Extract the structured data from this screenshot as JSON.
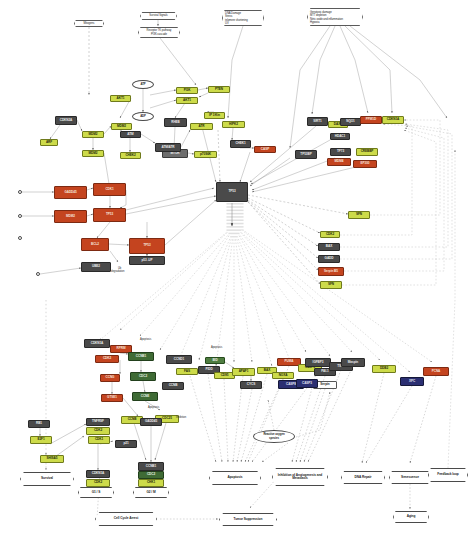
{
  "diagram": {
    "width": 471,
    "height": 543,
    "background": "#ffffff"
  },
  "palette": {
    "red": "#c4441f",
    "gray": "#4a4a4a",
    "yellow_green": "#cddb4a",
    "green": "#3f6b35",
    "navy": "#2b2f72",
    "orange": "#d2582a",
    "white": "#ffffff",
    "edge": "#8a8a8a"
  },
  "stimuli": [
    {
      "id": "st_mito",
      "lines": [
        "Mitogens"
      ],
      "x": 74,
      "y": 20,
      "w": 30,
      "h": 7,
      "plain": true
    },
    {
      "id": "st_surv",
      "lines": [
        "Survival Signals"
      ],
      "x": 140,
      "y": 12,
      "w": 37,
      "h": 8
    },
    {
      "id": "st_pi3k",
      "lines": [
        "Receptor TK pathway",
        "PI3K cascade"
      ],
      "x": 138,
      "y": 27,
      "w": 42,
      "h": 11
    },
    {
      "id": "st_dna",
      "lines": [
        "DNA Damage",
        "Stress",
        "telomere shortening",
        "UV"
      ],
      "x": 222,
      "y": 10,
      "w": 42,
      "h": 16
    },
    {
      "id": "st_geno",
      "lines": [
        "Genotoxic damage",
        "MTT depletion",
        "Nitric oxide and inflammation",
        "Hypoxia"
      ],
      "x": 307,
      "y": 8,
      "w": 56,
      "h": 18
    }
  ],
  "metabolites": [
    {
      "id": "m_atp",
      "lines": [
        "ATP"
      ],
      "x": 132,
      "y": 80,
      "w": 22,
      "h": 9
    },
    {
      "id": "m_adp",
      "lines": [
        "ADP"
      ],
      "x": 132,
      "y": 112,
      "w": 22,
      "h": 9
    },
    {
      "id": "m_ros",
      "lines": [
        "Reactive oxygen",
        "species"
      ],
      "x": 253,
      "y": 430,
      "w": 42,
      "h": 13
    }
  ],
  "genes": [
    {
      "id": "g_pi3k",
      "label": "PI3K",
      "color": "c-yel",
      "x": 176,
      "y": 87,
      "w": 22,
      "h": 7
    },
    {
      "id": "g_akt1",
      "label": "AKT1",
      "color": "c-yel",
      "x": 176,
      "y": 97,
      "w": 22,
      "h": 7
    },
    {
      "id": "g_pten",
      "label": "PTEN",
      "color": "c-yel",
      "x": 208,
      "y": 86,
      "w": 22,
      "h": 7
    },
    {
      "id": "g_ptgs",
      "label": "IP 3 Kin",
      "color": "c-yel",
      "x": 204,
      "y": 112,
      "w": 21,
      "h": 7
    },
    {
      "id": "g_rheb",
      "label": "RHEB",
      "color": "c-gray",
      "x": 164,
      "y": 118,
      "w": 23,
      "h": 9
    },
    {
      "id": "g_mtor",
      "label": "MTOR",
      "color": "c-gray2",
      "x": 162,
      "y": 149,
      "w": 26,
      "h": 9
    },
    {
      "id": "g_s6k",
      "label": "p70S6K",
      "color": "c-yel",
      "x": 194,
      "y": 151,
      "w": 23,
      "h": 7
    },
    {
      "id": "g_ak1l",
      "label": "AKT1",
      "color": "c-yel",
      "x": 110,
      "y": 95,
      "w": 21,
      "h": 7
    },
    {
      "id": "g_mdm1",
      "label": "MDM2",
      "color": "c-yel",
      "x": 111,
      "y": 123,
      "w": 21,
      "h": 7
    },
    {
      "id": "g_cdkn",
      "label": "CDKN2A",
      "color": "c-gray",
      "x": 55,
      "y": 116,
      "w": 22,
      "h": 9
    },
    {
      "id": "g_arf",
      "label": "ARF",
      "color": "c-yel",
      "x": 40,
      "y": 139,
      "w": 18,
      "h": 7
    },
    {
      "id": "g_mdm2a",
      "label": "MDM2",
      "color": "c-yel",
      "x": 82,
      "y": 131,
      "w": 22,
      "h": 7
    },
    {
      "id": "g_mdm2b",
      "label": "MDM2",
      "color": "c-yel",
      "x": 82,
      "y": 150,
      "w": 22,
      "h": 7
    },
    {
      "id": "g_atmx",
      "label": "ATM",
      "color": "c-gray",
      "x": 120,
      "y": 131,
      "w": 21,
      "h": 7
    },
    {
      "id": "g_chk",
      "label": "CHEK2",
      "color": "c-yel",
      "x": 120,
      "y": 152,
      "w": 21,
      "h": 7
    },
    {
      "id": "g_atm2",
      "label": "ATM/ATR",
      "color": "c-gray",
      "x": 155,
      "y": 143,
      "w": 26,
      "h": 9
    },
    {
      "id": "g_atr",
      "label": "ATR",
      "color": "c-yel",
      "x": 190,
      "y": 123,
      "w": 23,
      "h": 7
    },
    {
      "id": "g_hipk",
      "label": "HIPK2",
      "color": "c-yel",
      "x": 222,
      "y": 121,
      "w": 23,
      "h": 7
    },
    {
      "id": "g_chek1",
      "label": "CHEK1",
      "color": "c-gray",
      "x": 230,
      "y": 140,
      "w": 21,
      "h": 8
    },
    {
      "id": "g_casp",
      "label": "CASP",
      "color": "c-red",
      "x": 254,
      "y": 146,
      "w": 22,
      "h": 7
    },
    {
      "id": "g_gadd",
      "label": "GADD45",
      "color": "c-red",
      "x": 54,
      "y": 186,
      "w": 33,
      "h": 13
    },
    {
      "id": "g_cdk1",
      "label": "CDK1",
      "color": "c-red",
      "x": 93,
      "y": 183,
      "w": 33,
      "h": 13
    },
    {
      "id": "g_mdm2c",
      "label": "MDM2",
      "color": "c-red",
      "x": 54,
      "y": 210,
      "w": 33,
      "h": 13
    },
    {
      "id": "g_p53c",
      "label": "TP53",
      "color": "c-red",
      "x": 93,
      "y": 208,
      "w": 33,
      "h": 14
    },
    {
      "id": "g_bcl2",
      "label": "BCL2",
      "color": "c-red",
      "x": 81,
      "y": 238,
      "w": 28,
      "h": 13
    },
    {
      "id": "g_p53big",
      "label": "TP53",
      "color": "c-red",
      "x": 129,
      "y": 238,
      "w": 36,
      "h": 16
    },
    {
      "id": "g_p53g",
      "label": "p53 -UP",
      "color": "c-gray",
      "x": 129,
      "y": 256,
      "w": 36,
      "h": 9
    },
    {
      "id": "g_ubq",
      "label": "UBE2",
      "color": "c-gray",
      "x": 81,
      "y": 262,
      "w": 30,
      "h": 10
    },
    {
      "id": "g_hub",
      "label": "TP53",
      "color": "c-gray",
      "x": 216,
      "y": 182,
      "w": 32,
      "h": 20
    },
    {
      "id": "g_sirt",
      "label": "SIRT1",
      "color": "c-gray",
      "x": 307,
      "y": 117,
      "w": 21,
      "h": 9
    },
    {
      "id": "g_daxx",
      "label": "DAXX",
      "color": "c-yel",
      "x": 328,
      "y": 121,
      "w": 20,
      "h": 7
    },
    {
      "id": "g_hdac",
      "label": "HDAC1",
      "color": "c-gray",
      "x": 330,
      "y": 133,
      "w": 20,
      "h": 7
    },
    {
      "id": "g_nqo",
      "label": "NQO1",
      "color": "c-gray",
      "x": 340,
      "y": 118,
      "w": 21,
      "h": 8
    },
    {
      "id": "g_ppm",
      "label": "PPM1D",
      "color": "c-red",
      "x": 360,
      "y": 116,
      "w": 22,
      "h": 8
    },
    {
      "id": "g_cdkn1",
      "label": "CDKN1A",
      "color": "c-yel",
      "x": 382,
      "y": 116,
      "w": 22,
      "h": 8
    },
    {
      "id": "g_tp73",
      "label": "TP73",
      "color": "c-gray",
      "x": 330,
      "y": 148,
      "w": 21,
      "h": 8
    },
    {
      "id": "g_mdm4",
      "label": "MDM4",
      "color": "c-red",
      "x": 327,
      "y": 158,
      "w": 24,
      "h": 8
    },
    {
      "id": "g_cren",
      "label": "CREBBP",
      "color": "c-yel",
      "x": 356,
      "y": 148,
      "w": 22,
      "h": 8
    },
    {
      "id": "g_ep300",
      "label": "EP300",
      "color": "c-red",
      "x": 353,
      "y": 160,
      "w": 24,
      "h": 8
    },
    {
      "id": "g_tp53b",
      "label": "TP53BP",
      "color": "c-gray",
      "x": 295,
      "y": 150,
      "w": 22,
      "h": 9
    },
    {
      "id": "g_fb1",
      "label": "SFN",
      "color": "c-yel",
      "x": 348,
      "y": 211,
      "w": 22,
      "h": 8
    },
    {
      "id": "g_fb2",
      "label": "CDK2",
      "color": "c-yel",
      "x": 320,
      "y": 231,
      "w": 20,
      "h": 7
    },
    {
      "id": "g_fb3",
      "label": "BAX",
      "color": "c-gray",
      "x": 318,
      "y": 243,
      "w": 22,
      "h": 8
    },
    {
      "id": "g_fb4",
      "label": "GADD",
      "color": "c-gray",
      "x": 318,
      "y": 255,
      "w": 22,
      "h": 8
    },
    {
      "id": "g_fb5",
      "label": "Serpin B5",
      "color": "c-red",
      "x": 318,
      "y": 267,
      "w": 26,
      "h": 9
    },
    {
      "id": "g_fb6",
      "label": "SFN",
      "color": "c-yel",
      "x": 320,
      "y": 281,
      "w": 22,
      "h": 8
    },
    {
      "id": "g_cdkn1b",
      "label": "CDKN1A",
      "color": "c-gray",
      "x": 84,
      "y": 339,
      "w": 26,
      "h": 9
    },
    {
      "id": "g_rprm",
      "label": "RPRM",
      "color": "c-red",
      "x": 110,
      "y": 345,
      "w": 22,
      "h": 8
    },
    {
      "id": "g_cdk2b",
      "label": "CDK2",
      "color": "c-red",
      "x": 95,
      "y": 355,
      "w": 24,
      "h": 8
    },
    {
      "id": "g_ccnb",
      "label": "CCNB1",
      "color": "c-grn",
      "x": 128,
      "y": 352,
      "w": 26,
      "h": 9
    },
    {
      "id": "g_cdc2",
      "label": "CDC2",
      "color": "c-grn",
      "x": 130,
      "y": 372,
      "w": 26,
      "h": 9
    },
    {
      "id": "g_ccng",
      "label": "CCNG",
      "color": "c-red",
      "x": 100,
      "y": 374,
      "w": 20,
      "h": 8
    },
    {
      "id": "g_gtse",
      "label": "GTSE1",
      "color": "c-red",
      "x": 101,
      "y": 394,
      "w": 22,
      "h": 8
    },
    {
      "id": "g_ccne",
      "label": "CCNE",
      "color": "c-grn",
      "x": 132,
      "y": 392,
      "w": 26,
      "h": 9
    },
    {
      "id": "g_ccnb2",
      "label": "CCNB",
      "color": "c-gray",
      "x": 162,
      "y": 382,
      "w": 22,
      "h": 8
    },
    {
      "id": "g_ccnd",
      "label": "CCND1",
      "color": "c-gray",
      "x": 166,
      "y": 355,
      "w": 26,
      "h": 9
    },
    {
      "id": "g_fas",
      "label": "FAS",
      "color": "c-yel",
      "x": 176,
      "y": 368,
      "w": 22,
      "h": 7
    },
    {
      "id": "g_pidd",
      "label": "PIDD",
      "color": "c-gray",
      "x": 198,
      "y": 366,
      "w": 22,
      "h": 8
    },
    {
      "id": "g_cd95",
      "label": "CD95",
      "color": "c-yel",
      "x": 214,
      "y": 372,
      "w": 21,
      "h": 7
    },
    {
      "id": "g_bid",
      "label": "BID",
      "color": "c-grn2",
      "x": 205,
      "y": 357,
      "w": 20,
      "h": 7
    },
    {
      "id": "g_apaf",
      "label": "APAF1",
      "color": "c-yel",
      "x": 232,
      "y": 368,
      "w": 23,
      "h": 8
    },
    {
      "id": "g_cycs",
      "label": "CYCS",
      "color": "c-gray",
      "x": 240,
      "y": 381,
      "w": 22,
      "h": 8
    },
    {
      "id": "g_bax2",
      "label": "BAX",
      "color": "c-yel",
      "x": 257,
      "y": 367,
      "w": 20,
      "h": 7
    },
    {
      "id": "g_noxa",
      "label": "NOXA",
      "color": "c-yel",
      "x": 272,
      "y": 372,
      "w": 22,
      "h": 7
    },
    {
      "id": "g_puma",
      "label": "PUMA",
      "color": "c-red",
      "x": 277,
      "y": 358,
      "w": 24,
      "h": 8
    },
    {
      "id": "g_casp8",
      "label": "CASP8",
      "color": "c-navy",
      "x": 278,
      "y": 380,
      "w": 26,
      "h": 9
    },
    {
      "id": "g_casp9",
      "label": "CASP9",
      "color": "c-yel",
      "x": 298,
      "y": 364,
      "w": 24,
      "h": 8
    },
    {
      "id": "g_igfbp",
      "label": "IGFBP3",
      "color": "c-gray",
      "x": 305,
      "y": 358,
      "w": 26,
      "h": 9
    },
    {
      "id": "g_pai",
      "label": "PAI-1",
      "color": "c-gray",
      "x": 314,
      "y": 368,
      "w": 22,
      "h": 8
    },
    {
      "id": "g_serp",
      "label": "Serpin",
      "color": "c-white",
      "x": 313,
      "y": 381,
      "w": 24,
      "h": 8
    },
    {
      "id": "g_cas3",
      "label": "CASP3",
      "color": "c-navy",
      "x": 296,
      "y": 379,
      "w": 22,
      "h": 9
    },
    {
      "id": "g_tspn",
      "label": "TSP1",
      "color": "c-gray",
      "x": 329,
      "y": 362,
      "w": 24,
      "h": 9
    },
    {
      "id": "g_maspin",
      "label": "Maspin",
      "color": "c-gray",
      "x": 341,
      "y": 358,
      "w": 24,
      "h": 9
    },
    {
      "id": "g_ddb2",
      "label": "DDB2",
      "color": "c-yel",
      "x": 372,
      "y": 365,
      "w": 24,
      "h": 8
    },
    {
      "id": "g_xpc",
      "label": "XPC",
      "color": "c-navy",
      "x": 400,
      "y": 377,
      "w": 24,
      "h": 9
    },
    {
      "id": "g_pcna",
      "label": "PCNA",
      "color": "c-red",
      "x": 423,
      "y": 367,
      "w": 26,
      "h": 9
    },
    {
      "id": "g_tnfrs",
      "label": "TNFRSF",
      "color": "c-gray",
      "x": 86,
      "y": 418,
      "w": 24,
      "h": 8
    },
    {
      "id": "g_cdk2c",
      "label": "CDK2",
      "color": "c-yel",
      "x": 86,
      "y": 427,
      "w": 24,
      "h": 8
    },
    {
      "id": "g_cdk1b",
      "label": "CDK1",
      "color": "c-yel",
      "x": 88,
      "y": 436,
      "w": 22,
      "h": 8
    },
    {
      "id": "g_p21",
      "label": "p21",
      "color": "c-gray",
      "x": 115,
      "y": 440,
      "w": 22,
      "h": 8
    },
    {
      "id": "g_cdkn2",
      "label": "CDKN1A",
      "color": "c-gray",
      "x": 86,
      "y": 470,
      "w": 24,
      "h": 8
    },
    {
      "id": "g_cdk2d",
      "label": "CDK2",
      "color": "c-yel",
      "x": 86,
      "y": 479,
      "w": 24,
      "h": 8
    },
    {
      "id": "g_ccnb3",
      "label": "CCNB",
      "color": "c-yel",
      "x": 121,
      "y": 416,
      "w": 22,
      "h": 8
    },
    {
      "id": "g_cdc2b",
      "label": "CDC25",
      "color": "c-yel",
      "x": 155,
      "y": 415,
      "w": 24,
      "h": 8
    },
    {
      "id": "g_gadd2",
      "label": "GADD45",
      "color": "c-gray",
      "x": 140,
      "y": 418,
      "w": 22,
      "h": 8
    },
    {
      "id": "g_ccnb4",
      "label": "CCNB1",
      "color": "c-gray",
      "x": 138,
      "y": 462,
      "w": 26,
      "h": 9
    },
    {
      "id": "g_cdc2c",
      "label": "CDC2",
      "color": "c-grn",
      "x": 138,
      "y": 471,
      "w": 26,
      "h": 8
    },
    {
      "id": "g_chk1b",
      "label": "CHK1",
      "color": "c-yel",
      "x": 138,
      "y": 479,
      "w": 26,
      "h": 8
    },
    {
      "id": "g_g1cdk",
      "label": "CDK2",
      "color": "c-yel",
      "x": 86,
      "y": 488,
      "w": 24,
      "h": 7
    },
    {
      "id": "g_rb",
      "label": "RB1",
      "color": "c-gray",
      "x": 28,
      "y": 420,
      "w": 22,
      "h": 8
    },
    {
      "id": "g_e2f",
      "label": "E2F1",
      "color": "c-yel",
      "x": 30,
      "y": 436,
      "w": 22,
      "h": 8
    },
    {
      "id": "g_sh",
      "label": "SHISA5",
      "color": "c-yel",
      "x": 40,
      "y": 455,
      "w": 24,
      "h": 8
    }
  ],
  "phenotypes": [
    {
      "id": "p_surv",
      "label": "Survival",
      "x": 20,
      "y": 472,
      "w": 54,
      "h": 14
    },
    {
      "id": "p_g1s",
      "label": "G1 / S",
      "x": 78,
      "y": 487,
      "w": 36,
      "h": 11
    },
    {
      "id": "p_g2m",
      "label": "G2 / M",
      "x": 133,
      "y": 487,
      "w": 36,
      "h": 11
    },
    {
      "id": "p_apop",
      "label": "Apoptosis",
      "x": 209,
      "y": 471,
      "w": 52,
      "h": 14
    },
    {
      "id": "p_angio",
      "label": "Inhibition of Angiogenesis and Metastasis",
      "x": 272,
      "y": 468,
      "w": 56,
      "h": 18
    },
    {
      "id": "p_dnarep",
      "label": "DNA Repair",
      "x": 341,
      "y": 471,
      "w": 44,
      "h": 13
    },
    {
      "id": "p_senes",
      "label": "Senescence",
      "x": 389,
      "y": 471,
      "w": 42,
      "h": 13
    },
    {
      "id": "p_fb",
      "label": "Feedback loop",
      "x": 428,
      "y": 468,
      "w": 40,
      "h": 14
    },
    {
      "id": "p_cca",
      "label": "Cell Cycle Arrest",
      "x": 95,
      "y": 512,
      "w": 62,
      "h": 14
    },
    {
      "id": "p_tsup",
      "label": "Tumor Suppression",
      "x": 219,
      "y": 513,
      "w": 58,
      "h": 13
    },
    {
      "id": "p_aging",
      "label": "Aging",
      "x": 393,
      "y": 511,
      "w": 36,
      "h": 12
    }
  ],
  "free_labels": [
    {
      "id": "lb_apop1",
      "text": "Apoptosis",
      "x": 140,
      "y": 338
    },
    {
      "id": "lb_apop2",
      "text": "Apoptosis",
      "x": 211,
      "y": 346
    },
    {
      "id": "lb_apop3",
      "text": "Apoptosis",
      "x": 148,
      "y": 406
    },
    {
      "id": "lb_inhib",
      "text": "Inhibition",
      "x": 176,
      "y": 416
    },
    {
      "id": "lb_deg",
      "text": "degradation",
      "x": 111,
      "y": 270
    },
    {
      "id": "lb_ub",
      "text": "Ub",
      "x": 118,
      "y": 267
    }
  ],
  "anchors": [
    {
      "id": "a1",
      "x": 18,
      "y": 190
    },
    {
      "id": "a2",
      "x": 18,
      "y": 214
    },
    {
      "id": "a3",
      "x": 36,
      "y": 272
    },
    {
      "id": "a4",
      "x": 18,
      "y": 236
    }
  ]
}
